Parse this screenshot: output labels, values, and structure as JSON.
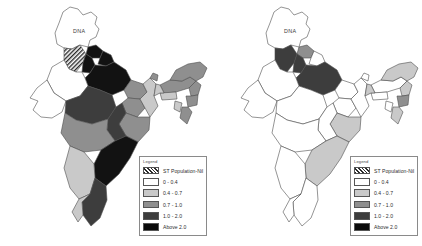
{
  "figure": {
    "type": "choropleth-map-pair",
    "background_color": "#ffffff",
    "border_color": "#4d4d4d"
  },
  "legend": {
    "title": "Legend",
    "entries": [
      {
        "label": "ST Population-Nil",
        "fill": "pattern-crosshatch",
        "color": "#8d8d8d"
      },
      {
        "label": "0 - 0.4",
        "fill": "solid",
        "color": "#ffffff"
      },
      {
        "label": "0.4 - 0.7",
        "fill": "solid",
        "color": "#c9c9c9"
      },
      {
        "label": "0.7 - 1.0",
        "fill": "solid",
        "color": "#8f8f8f"
      },
      {
        "label": "1.0 - 2.0",
        "fill": "solid",
        "color": "#3d3d3d"
      },
      {
        "label": "Above 2.0",
        "fill": "solid",
        "color": "#0a0a0a"
      }
    ]
  },
  "maps": [
    {
      "id": "map-left",
      "annotation": "DNA",
      "regions": [
        {
          "name": "jammu-kashmir",
          "class": "c0"
        },
        {
          "name": "himachal-pradesh",
          "class": "c5"
        },
        {
          "name": "punjab",
          "class": "chatch"
        },
        {
          "name": "haryana",
          "class": "c5"
        },
        {
          "name": "uttarakhand",
          "class": "c5"
        },
        {
          "name": "uttar-pradesh",
          "class": "c5"
        },
        {
          "name": "rajasthan",
          "class": "c1"
        },
        {
          "name": "gujarat",
          "class": "c1"
        },
        {
          "name": "madhya-pradesh",
          "class": "c4"
        },
        {
          "name": "bihar",
          "class": "c3"
        },
        {
          "name": "jharkhand",
          "class": "c3"
        },
        {
          "name": "west-bengal",
          "class": "c2"
        },
        {
          "name": "odisha",
          "class": "c3"
        },
        {
          "name": "chhattisgarh",
          "class": "c4"
        },
        {
          "name": "maharashtra",
          "class": "c3"
        },
        {
          "name": "telangana-andhra",
          "class": "c5"
        },
        {
          "name": "karnataka",
          "class": "c2"
        },
        {
          "name": "tamil-nadu",
          "class": "c4"
        },
        {
          "name": "kerala",
          "class": "c2"
        },
        {
          "name": "sikkim",
          "class": "c3"
        },
        {
          "name": "assam",
          "class": "c3"
        },
        {
          "name": "meghalaya",
          "class": "c2"
        },
        {
          "name": "arunachal-pradesh",
          "class": "c3"
        },
        {
          "name": "nagaland",
          "class": "c3"
        },
        {
          "name": "manipur",
          "class": "c3"
        },
        {
          "name": "mizoram",
          "class": "c3"
        },
        {
          "name": "tripura",
          "class": "c2"
        }
      ]
    },
    {
      "id": "map-right",
      "annotation": "DNA",
      "regions": [
        {
          "name": "jammu-kashmir",
          "class": "c0"
        },
        {
          "name": "himachal-pradesh",
          "class": "c3"
        },
        {
          "name": "punjab",
          "class": "c4"
        },
        {
          "name": "haryana",
          "class": "c4"
        },
        {
          "name": "uttarakhand",
          "class": "c1"
        },
        {
          "name": "uttar-pradesh",
          "class": "c4"
        },
        {
          "name": "rajasthan",
          "class": "c1"
        },
        {
          "name": "gujarat",
          "class": "c1"
        },
        {
          "name": "madhya-pradesh",
          "class": "c1"
        },
        {
          "name": "bihar",
          "class": "c1"
        },
        {
          "name": "jharkhand",
          "class": "c1"
        },
        {
          "name": "west-bengal",
          "class": "c1"
        },
        {
          "name": "odisha",
          "class": "c2"
        },
        {
          "name": "chhattisgarh",
          "class": "c1"
        },
        {
          "name": "maharashtra",
          "class": "c1"
        },
        {
          "name": "telangana-andhra",
          "class": "c2"
        },
        {
          "name": "karnataka",
          "class": "c1"
        },
        {
          "name": "tamil-nadu",
          "class": "c1"
        },
        {
          "name": "kerala",
          "class": "c1"
        },
        {
          "name": "sikkim",
          "class": "c1"
        },
        {
          "name": "assam",
          "class": "c1"
        },
        {
          "name": "meghalaya",
          "class": "c1"
        },
        {
          "name": "arunachal-pradesh",
          "class": "c2"
        },
        {
          "name": "nagaland",
          "class": "c2"
        },
        {
          "name": "manipur",
          "class": "c3"
        },
        {
          "name": "mizoram",
          "class": "c2"
        },
        {
          "name": "tripura",
          "class": "c1"
        }
      ]
    }
  ]
}
